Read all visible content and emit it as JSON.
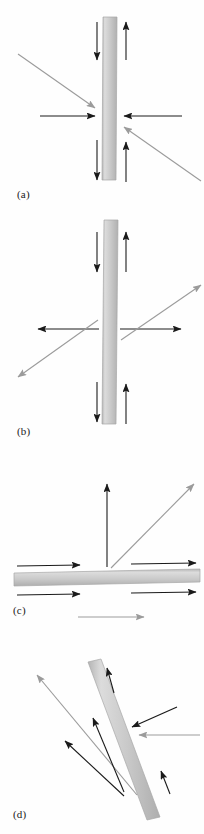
{
  "figure": {
    "background_color": "#fefefe",
    "panel_count": 4
  },
  "colors": {
    "bar_fill": "#c9c9c9",
    "bar_edge": "#a8a8a8",
    "bar_highlight": "#dcdcdc",
    "arrow_dark": "#1a1a1a",
    "arrow_gray": "#9b9b9b",
    "label_text": "#1a1a1a"
  },
  "panels": [
    {
      "id": "a",
      "label": "(a)",
      "bar": {
        "orientation": "vertical",
        "x": 102,
        "y": 17,
        "width": 14,
        "height": 163,
        "angle_deg": 0.6
      },
      "description": "vertical bar with opposing inward horizontal arrows and antiparallel vertical arrows",
      "arrows": [
        {
          "name": "top-left-down",
          "color": "dark",
          "x1": 97,
          "y1": 22,
          "x2": 97,
          "y2": 60,
          "head": "end"
        },
        {
          "name": "top-right-up",
          "color": "dark",
          "x1": 126,
          "y1": 60,
          "x2": 126,
          "y2": 22,
          "head": "end"
        },
        {
          "name": "left-horizontal-in",
          "color": "dark",
          "x1": 40,
          "y1": 116,
          "x2": 99,
          "y2": 116,
          "head": "end"
        },
        {
          "name": "right-horizontal-in",
          "color": "dark",
          "x1": 182,
          "y1": 116,
          "x2": 120,
          "y2": 116,
          "head": "end"
        },
        {
          "name": "upper-left-diagonal-in",
          "color": "gray",
          "x1": 18,
          "y1": 54,
          "x2": 98,
          "y2": 110,
          "head": "end"
        },
        {
          "name": "lower-right-diagonal-in",
          "color": "gray",
          "x1": 200,
          "y1": 180,
          "x2": 121,
          "y2": 124,
          "head": "end"
        },
        {
          "name": "bottom-left-down",
          "color": "dark",
          "x1": 97,
          "y1": 140,
          "x2": 97,
          "y2": 178,
          "head": "end"
        },
        {
          "name": "bottom-right-up",
          "color": "dark",
          "x1": 126,
          "y1": 178,
          "x2": 126,
          "y2": 140,
          "head": "end"
        }
      ]
    },
    {
      "id": "b",
      "label": "(b)",
      "bar": {
        "orientation": "vertical",
        "x": 102,
        "y": 12,
        "width": 14,
        "height": 200,
        "angle_deg": 0.6
      },
      "description": "vertical bar with opposing outward horizontal arrows and antiparallel vertical arrows",
      "arrows": [
        {
          "name": "top-left-down",
          "color": "dark",
          "x1": 97,
          "y1": 22,
          "x2": 97,
          "y2": 60,
          "head": "end"
        },
        {
          "name": "top-right-up",
          "color": "dark",
          "x1": 126,
          "y1": 60,
          "x2": 126,
          "y2": 22,
          "head": "end"
        },
        {
          "name": "left-horizontal-out",
          "color": "dark",
          "x1": 99,
          "y1": 118,
          "x2": 38,
          "y2": 118,
          "head": "end"
        },
        {
          "name": "right-horizontal-out",
          "color": "dark",
          "x1": 120,
          "y1": 118,
          "x2": 181,
          "y2": 118,
          "head": "end"
        },
        {
          "name": "upper-right-diagonal-out",
          "color": "gray",
          "x1": 121,
          "y1": 128,
          "x2": 200,
          "y2": 72,
          "head": "end"
        },
        {
          "name": "lower-left-diagonal-out",
          "color": "gray",
          "x1": 98,
          "y1": 110,
          "x2": 18,
          "y2": 168,
          "head": "end"
        },
        {
          "name": "bottom-left-down",
          "color": "dark",
          "x1": 97,
          "y1": 172,
          "x2": 97,
          "y2": 210,
          "head": "end"
        },
        {
          "name": "bottom-right-up",
          "color": "dark",
          "x1": 126,
          "y1": 210,
          "x2": 126,
          "y2": 172,
          "head": "end"
        }
      ]
    },
    {
      "id": "c",
      "label": "(c)",
      "bar": {
        "orientation": "horizontal",
        "x": 14,
        "y": 140,
        "width": 186,
        "height": 13,
        "angle_deg": -1.2
      },
      "description": "horizontal bar with shear arrows above and below, plus vertical and diagonal arrows",
      "arrows": [
        {
          "name": "vertical-up",
          "color": "dark",
          "x1": 107,
          "y1": 135,
          "x2": 107,
          "y2": 52,
          "head": "end"
        },
        {
          "name": "diagonal-up-right",
          "color": "gray",
          "x1": 110,
          "y1": 136,
          "x2": 196,
          "y2": 52,
          "head": "end"
        },
        {
          "name": "above-left-right",
          "color": "dark",
          "x1": 17,
          "y1": 135,
          "x2": 82,
          "y2": 135,
          "head": "end"
        },
        {
          "name": "above-right-right",
          "color": "dark",
          "x1": 131,
          "y1": 134,
          "x2": 196,
          "y2": 134,
          "head": "end"
        },
        {
          "name": "below-left-right",
          "color": "dark",
          "x1": 17,
          "y1": 163,
          "x2": 82,
          "y2": 163,
          "head": "end"
        },
        {
          "name": "below-right-right",
          "color": "dark",
          "x1": 131,
          "y1": 163,
          "x2": 196,
          "y2": 163,
          "head": "end"
        },
        {
          "name": "bottom-gray-right",
          "color": "gray",
          "x1": 78,
          "y1": 186,
          "x2": 146,
          "y2": 186,
          "head": "end"
        }
      ]
    },
    {
      "id": "d",
      "label": "(d)",
      "bar": {
        "orientation": "inclined",
        "angle_deg": 16,
        "x": 112,
        "y": 26,
        "width": 14,
        "height": 160
      },
      "description": "inclined bar with incoming arrows on the right and outgoing arrows to the upper left",
      "arrows": [
        {
          "name": "incoming-dark-upper-right",
          "color": "dark",
          "x1": 177,
          "y1": 77,
          "x2": 126,
          "y2": 100,
          "head": "end"
        },
        {
          "name": "incoming-gray-right",
          "color": "gray",
          "x1": 199,
          "y1": 105,
          "x2": 134,
          "y2": 105,
          "head": "end"
        },
        {
          "name": "outgoing-gray-upper-left",
          "color": "gray",
          "x1": 137,
          "y1": 165,
          "x2": 38,
          "y2": 46,
          "head": "end"
        },
        {
          "name": "outgoing-dark-upper-left",
          "color": "dark",
          "x1": 124,
          "y1": 163,
          "x2": 94,
          "y2": 90,
          "head": "end"
        },
        {
          "name": "outgoing-dark-lower-left",
          "color": "dark",
          "x1": 124,
          "y1": 165,
          "x2": 66,
          "y2": 112,
          "head": "end"
        },
        {
          "name": "surface-arrow-top",
          "color": "dark",
          "x1": 114,
          "y1": 63,
          "x2": 108,
          "y2": 37,
          "head": "end"
        },
        {
          "name": "surface-arrow-bottom",
          "color": "dark",
          "x1": 169,
          "y1": 163,
          "x2": 160,
          "y2": 141,
          "head": "end"
        }
      ]
    }
  ]
}
